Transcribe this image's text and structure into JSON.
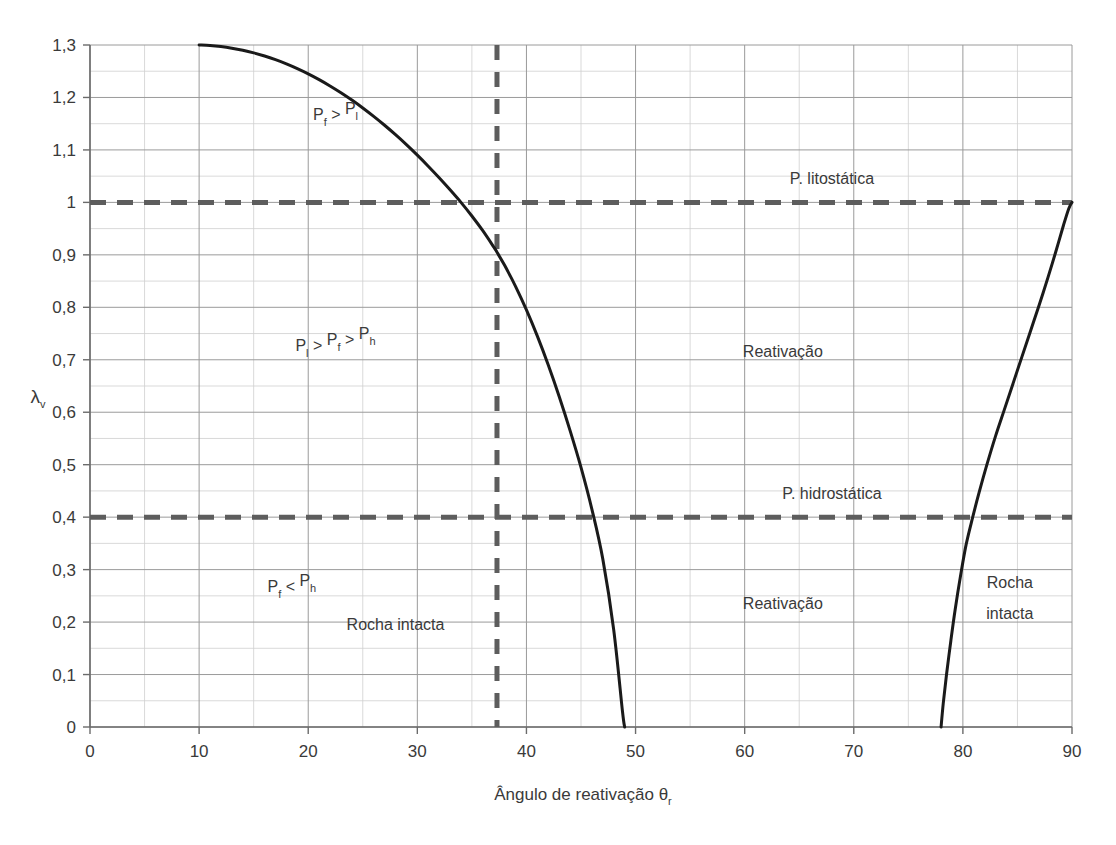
{
  "figure": {
    "clipped_title": "",
    "axis": {
      "y_title": "λ",
      "y_title_sub": "v",
      "x_title": "Ângulo de reativação θ",
      "x_title_sub": "r"
    }
  },
  "chart_data": {
    "type": "line",
    "title": "",
    "xlabel": "Ângulo de reativação θr",
    "ylabel": "λv",
    "xlim": [
      0,
      90
    ],
    "ylim": [
      0,
      1.3
    ],
    "grid": true,
    "legend": null,
    "x_ticks": [
      "0",
      "10",
      "20",
      "30",
      "40",
      "50",
      "60",
      "70",
      "80",
      "90"
    ],
    "x_tick_values": [
      0,
      10,
      20,
      30,
      40,
      50,
      60,
      70,
      80,
      90
    ],
    "x_minor_step": 5,
    "y_ticks": [
      "0",
      "0,1",
      "0,2",
      "0,3",
      "0,4",
      "0,5",
      "0,6",
      "0,7",
      "0,8",
      "0,9",
      "1",
      "1,1",
      "1,2",
      "1,3"
    ],
    "y_tick_values": [
      0,
      0.1,
      0.2,
      0.3,
      0.4,
      0.5,
      0.6,
      0.7,
      0.8,
      0.9,
      1.0,
      1.1,
      1.2,
      1.3
    ],
    "y_minor_step": 0.05,
    "series": [
      {
        "name": "Curva de reativação esquerda",
        "style": "solid",
        "color": "#1a1a1a",
        "points": [
          [
            10.0,
            1.3
          ],
          [
            11.0,
            1.299
          ],
          [
            12.0,
            1.297
          ],
          [
            13.0,
            1.294
          ],
          [
            14.0,
            1.29
          ],
          [
            15.0,
            1.285
          ],
          [
            16.0,
            1.279
          ],
          [
            17.0,
            1.272
          ],
          [
            18.0,
            1.264
          ],
          [
            19.0,
            1.255
          ],
          [
            20.0,
            1.245
          ],
          [
            21.0,
            1.234
          ],
          [
            22.0,
            1.222
          ],
          [
            23.0,
            1.209
          ],
          [
            24.0,
            1.195
          ],
          [
            25.0,
            1.18
          ],
          [
            26.0,
            1.164
          ],
          [
            27.0,
            1.147
          ],
          [
            28.0,
            1.129
          ],
          [
            29.0,
            1.11
          ],
          [
            30.0,
            1.09
          ],
          [
            31.0,
            1.069
          ],
          [
            32.0,
            1.047
          ],
          [
            33.0,
            1.024
          ],
          [
            34.0,
            1.0
          ],
          [
            35.0,
            0.974
          ],
          [
            36.0,
            0.946
          ],
          [
            37.0,
            0.915
          ],
          [
            37.3,
            0.905
          ],
          [
            38.0,
            0.88
          ],
          [
            39.0,
            0.84
          ],
          [
            40.0,
            0.795
          ],
          [
            41.0,
            0.745
          ],
          [
            42.0,
            0.69
          ],
          [
            43.0,
            0.63
          ],
          [
            44.0,
            0.565
          ],
          [
            45.0,
            0.495
          ],
          [
            46.0,
            0.415
          ],
          [
            47.0,
            0.32
          ],
          [
            48.0,
            0.185
          ],
          [
            48.8,
            0.03
          ],
          [
            49.0,
            0.0
          ]
        ]
      },
      {
        "name": "Curva de reativação direita",
        "style": "solid",
        "color": "#1a1a1a",
        "points": [
          [
            78.0,
            0.0
          ],
          [
            78.2,
            0.045
          ],
          [
            78.5,
            0.1
          ],
          [
            78.9,
            0.165
          ],
          [
            79.3,
            0.225
          ],
          [
            79.8,
            0.29
          ],
          [
            80.3,
            0.348
          ],
          [
            80.9,
            0.4
          ],
          [
            81.5,
            0.448
          ],
          [
            82.2,
            0.5
          ],
          [
            83.0,
            0.555
          ],
          [
            83.8,
            0.605
          ],
          [
            84.6,
            0.655
          ],
          [
            85.4,
            0.705
          ],
          [
            86.2,
            0.755
          ],
          [
            87.0,
            0.805
          ],
          [
            87.8,
            0.857
          ],
          [
            88.5,
            0.905
          ],
          [
            89.2,
            0.955
          ],
          [
            89.7,
            0.988
          ],
          [
            90.0,
            1.0
          ]
        ]
      }
    ],
    "reference_lines": [
      {
        "name": "P. litostática",
        "orientation": "horizontal",
        "value": 1.0,
        "style": "dashed",
        "color": "#5d5d5d",
        "label": "P. litostática",
        "label_x": 68,
        "label_y": 1.035
      },
      {
        "name": "P. hidrostática",
        "orientation": "horizontal",
        "value": 0.4,
        "style": "dashed",
        "color": "#5d5d5d",
        "label": "P. hidrostática",
        "label_x": 68,
        "label_y": 0.435
      },
      {
        "name": "Ângulo crítico",
        "orientation": "vertical",
        "value": 37.3,
        "style": "dashed",
        "color": "#5d5d5d",
        "label": "",
        "label_x": null,
        "label_y": null
      }
    ],
    "annotations": [
      {
        "name": "pf-gt-pl",
        "base": "P",
        "sub1": "f",
        "op": " > ",
        "base2": "P",
        "sub2": "l",
        "x": 22.5,
        "y": 1.145
      },
      {
        "name": "pl-gt-pf-gt-ph",
        "base": "P",
        "sub1": "l",
        "op": " > ",
        "base2": "P",
        "sub2": "f",
        "op2": " > ",
        "base3": "P",
        "sub3": "h",
        "x": 22.5,
        "y": 0.705
      },
      {
        "name": "pf-lt-ph",
        "base": "P",
        "sub1": "f",
        "op": " < ",
        "base2": "P",
        "sub2": "h",
        "x": 18.5,
        "y": 0.245
      },
      {
        "name": "reativacao-upper",
        "text": "Reativação",
        "x": 63.5,
        "y": 0.705
      },
      {
        "name": "reativacao-lower",
        "text": "Reativação",
        "x": 63.5,
        "y": 0.225
      },
      {
        "name": "rocha-intacta-center",
        "text": "Rocha  intacta",
        "x": 28.0,
        "y": 0.185
      },
      {
        "name": "rocha-intacta-right-1",
        "text": "Rocha",
        "x": 84.3,
        "y": 0.265
      },
      {
        "name": "rocha-intacta-right-2",
        "text": "intacta",
        "x": 84.3,
        "y": 0.205
      }
    ]
  }
}
